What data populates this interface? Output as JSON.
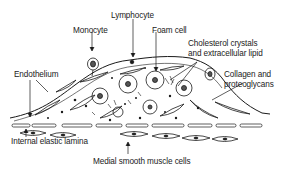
{
  "diagram": {
    "labels": {
      "monocyte": "Monocyte",
      "lymphocyte": "Lymphocyte",
      "foam_cell": "Foam cell",
      "cholesterol_line1": "Cholesterol crystals",
      "cholesterol_line2": "and extracellular lipid",
      "endothelium": "Endothelium",
      "collagen_line1": "Collagen and",
      "collagen_line2": "proteoglycans",
      "internal_elastic_lamina": "Internal elastic lamina",
      "medial_smooth_muscle": "Medial smooth muscle cells"
    },
    "colors": {
      "ink": "#1a1a1a",
      "background": "#ffffff",
      "nucleus_fill": "#555555"
    }
  }
}
